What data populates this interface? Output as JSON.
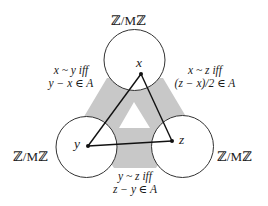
{
  "diagram": {
    "colors": {
      "band": "#c8c8c8",
      "circle_stroke": "#333333",
      "edge": "#111111",
      "text": "#1a1a1a"
    },
    "nodes": [
      {
        "id": "x",
        "label": "x",
        "ring_label": "ℤ/Mℤ",
        "position": "top"
      },
      {
        "id": "y",
        "label": "y",
        "ring_label": "ℤ/Mℤ",
        "position": "bottom-left"
      },
      {
        "id": "z",
        "label": "z",
        "ring_label": "ℤ/Mℤ",
        "position": "bottom-right"
      }
    ],
    "ring_labels": {
      "top": "ℤ/Mℤ",
      "left": "ℤ/Mℤ",
      "right": "ℤ/Mℤ"
    },
    "relations": {
      "xy": {
        "line1": "x ~ y iff",
        "line2": "y − x ∈ A"
      },
      "xz": {
        "line1": "x ~ z iff",
        "line2": "(z − x)/2 ∈ A"
      },
      "yz": {
        "line1": "y ~ z iff",
        "line2": "z − y ∈ A"
      }
    },
    "edges": [
      {
        "from": "x",
        "to": "y"
      },
      {
        "from": "x",
        "to": "z"
      },
      {
        "from": "y",
        "to": "z"
      }
    ]
  }
}
